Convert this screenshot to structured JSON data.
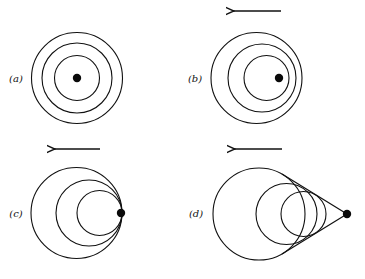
{
  "figure": {
    "colors": {
      "ink": "#111111",
      "background": "#ffffff"
    },
    "panels": [
      {
        "id": "a",
        "label": "(a)",
        "label_pos": [
          16,
          82
        ],
        "arrow": null,
        "source": [
          77,
          78
        ],
        "wavefronts": [
          {
            "cx": 77,
            "cy": 78,
            "r": 45.5
          },
          {
            "cx": 77,
            "cy": 78,
            "r": 35
          },
          {
            "cx": 77,
            "cy": 78,
            "r": 22.5
          }
        ],
        "tangents": []
      },
      {
        "id": "b",
        "label": "(b)",
        "label_pos": [
          195,
          82
        ],
        "arrow": {
          "x1": 281,
          "x2": 233,
          "y": 11
        },
        "source": [
          279,
          78
        ],
        "wavefronts": [
          {
            "cx": 256.5,
            "cy": 78,
            "r": 45.5
          },
          {
            "cx": 262,
            "cy": 78,
            "r": 34
          },
          {
            "cx": 266.5,
            "cy": 78,
            "r": 22.5
          }
        ],
        "tangents": []
      },
      {
        "id": "c",
        "label": "(c)",
        "label_pos": [
          16,
          217
        ],
        "arrow": {
          "x1": 100,
          "x2": 54,
          "y": 149
        },
        "source": [
          121,
          213
        ],
        "wavefronts": [
          {
            "cx": 76.5,
            "cy": 213,
            "r": 45.5
          },
          {
            "cx": 89,
            "cy": 213,
            "r": 33
          },
          {
            "cx": 99.5,
            "cy": 213,
            "r": 22.5
          }
        ],
        "tangents": []
      },
      {
        "id": "d",
        "label": "(d)",
        "label_pos": [
          196,
          217
        ],
        "arrow": {
          "x1": 282,
          "x2": 234,
          "y": 149
        },
        "source": [
          347,
          214
        ],
        "wavefronts": [
          {
            "cx": 259,
            "cy": 214,
            "r": 46
          },
          {
            "cx": 286.5,
            "cy": 214,
            "r": 30.5
          },
          {
            "cx": 303.5,
            "cy": 214,
            "r": 22.5
          }
        ],
        "tangents": [
          {
            "x1": 347,
            "y1": 214,
            "x2": 282,
            "y2": 174
          },
          {
            "x1": 347,
            "y1": 214,
            "x2": 282,
            "y2": 254
          }
        ]
      }
    ]
  }
}
